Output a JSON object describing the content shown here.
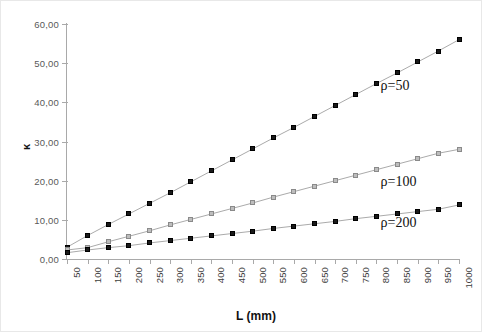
{
  "chart_data": {
    "type": "line",
    "title": "",
    "xlabel": "L (mm)",
    "ylabel": "κ",
    "xlim": [
      50,
      1000
    ],
    "ylim": [
      0,
      60
    ],
    "grid": false,
    "legend_position": "inline-right",
    "y_ticks": [
      "0,00",
      "10,00",
      "20,00",
      "30,00",
      "40,00",
      "50,00",
      "60,00"
    ],
    "y_tick_values": [
      0,
      10,
      20,
      30,
      40,
      50,
      60
    ],
    "categories": [
      50,
      100,
      150,
      200,
      250,
      300,
      350,
      400,
      450,
      500,
      550,
      600,
      650,
      700,
      750,
      800,
      850,
      900,
      950,
      1000
    ],
    "x_tick_labels": [
      "50",
      "100",
      "150",
      "200",
      "250",
      "300",
      "350",
      "400",
      "450",
      "500",
      "550",
      "600",
      "650",
      "700",
      "750",
      "800",
      "850",
      "900",
      "950",
      "1000"
    ],
    "series": [
      {
        "name": "ρ=50",
        "marker": "filled-square-dark",
        "color": "#1a1a1a",
        "values": [
          3.0,
          6.0,
          8.8,
          11.5,
          14.2,
          16.9,
          19.7,
          22.5,
          25.3,
          28.1,
          30.9,
          33.6,
          36.4,
          39.2,
          42.0,
          44.8,
          47.5,
          50.3,
          53.1,
          56.0
        ]
      },
      {
        "name": "ρ=100",
        "marker": "filled-square-gray",
        "color": "#bdbdbd",
        "values": [
          2.3,
          2.9,
          4.4,
          5.8,
          7.2,
          8.7,
          10.1,
          11.5,
          12.9,
          14.3,
          15.8,
          17.2,
          18.6,
          20.0,
          21.4,
          22.8,
          24.2,
          25.6,
          27.0,
          28.0
        ]
      },
      {
        "name": "ρ=200",
        "marker": "filled-square-dark",
        "color": "#1a1a1a",
        "values": [
          1.6,
          2.3,
          2.9,
          3.4,
          4.1,
          4.7,
          5.3,
          5.9,
          6.5,
          7.1,
          7.8,
          8.4,
          9.0,
          9.6,
          10.3,
          10.9,
          11.5,
          12.1,
          12.7,
          13.8
        ]
      }
    ],
    "series_label_positions": [
      {
        "x": 0.8,
        "y": 44.0
      },
      {
        "x": 0.8,
        "y": 19.5
      },
      {
        "x": 0.8,
        "y": 9.0
      }
    ]
  }
}
